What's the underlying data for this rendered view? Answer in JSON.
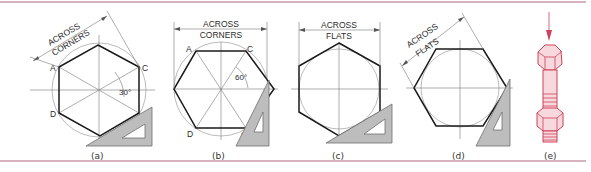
{
  "figure": {
    "panels": [
      {
        "id": "a",
        "caption": "(a)",
        "dimension_line_1": "ACROSS",
        "dimension_line_2": "CORNERS",
        "angle": "30°",
        "points": [
          "A",
          "C",
          "D",
          "B"
        ]
      },
      {
        "id": "b",
        "caption": "(b)",
        "dimension_line_1": "ACROSS",
        "dimension_line_2": "CORNERS",
        "angle": "60°",
        "points": [
          "A",
          "C",
          "D",
          "B"
        ]
      },
      {
        "id": "c",
        "caption": "(c)",
        "dimension_line_1": "ACROSS",
        "dimension_line_2": "FLATS"
      },
      {
        "id": "d",
        "caption": "(d)",
        "dimension_line_1": "ACROSS",
        "dimension_line_2": "FLATS"
      },
      {
        "id": "e",
        "caption": "(e)"
      }
    ],
    "colors": {
      "rule": "#c99aa9",
      "bolt": "#d0405a",
      "triangle": "#bdbdbd"
    }
  }
}
